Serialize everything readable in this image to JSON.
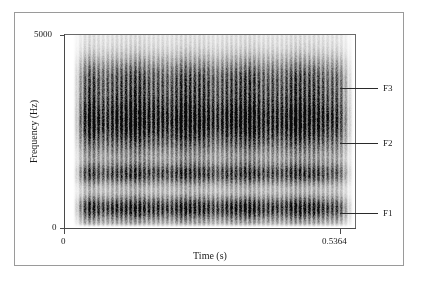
{
  "figure": {
    "kind": "spectrogram",
    "border_color": "#9a9a9a",
    "background": "#ffffff"
  },
  "axes": {
    "y_title": "Frequency (Hz)",
    "x_title": "Time (s)",
    "y_tick_max": "5000",
    "y_tick_min": "0",
    "x_tick_min": "0",
    "x_tick_max": "0.5364",
    "axis_color": "#4a4a4a"
  },
  "annotations": {
    "f3": {
      "label": "F3",
      "frequency_hz": 2800
    },
    "f2": {
      "label": "F2",
      "frequency_hz": 1400
    },
    "f1": {
      "label": "F1",
      "frequency_hz": 500
    }
  },
  "chart_data": {
    "type": "heatmap",
    "title": "",
    "subtitle": "",
    "xlabel": "Time (s)",
    "ylabel": "Frequency (Hz)",
    "xlim": [
      0,
      0.5364
    ],
    "ylim": [
      0,
      5000
    ],
    "xticks": [
      0,
      0.5364
    ],
    "xticklabels": [
      "0",
      "0.5364"
    ],
    "yticks": [
      0,
      5000
    ],
    "yticklabels": [
      "0",
      "5000"
    ],
    "grid": false,
    "legend": "none",
    "colormap": "grayscale-inverted",
    "annotations": [
      {
        "text": "F3",
        "frequency_hz": 2800,
        "position": "right-margin"
      },
      {
        "text": "F2",
        "frequency_hz": 1400,
        "position": "right-margin"
      },
      {
        "text": "F1",
        "frequency_hz": 500,
        "position": "right-margin"
      }
    ],
    "signal": {
      "onset_time_s": 0.025,
      "offset_time_s": 0.505,
      "fade_end_time_s": 0.5364,
      "fundamental_frequency_hz": 118,
      "pulse_count": 57
    },
    "formant_bands": [
      {
        "name": "F1",
        "center_hz": 500,
        "bandwidth_hz": 380,
        "intensity": 0.72
      },
      {
        "name": "F2",
        "center_hz": 1400,
        "bandwidth_hz": 360,
        "intensity": 0.6
      },
      {
        "name": "F3",
        "center_hz": 2800,
        "bandwidth_hz": 1100,
        "intensity": 0.95
      },
      {
        "name": "F4",
        "center_hz": 3900,
        "bandwidth_hz": 700,
        "intensity": 0.45
      }
    ]
  }
}
